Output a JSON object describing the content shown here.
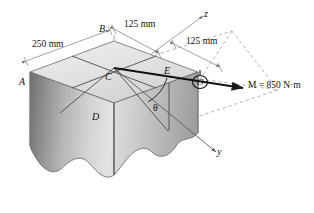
{
  "figure": {
    "background": "#ffffff",
    "line_color": "#4d4d4d",
    "dark_line_color": "#1a1a1a",
    "dash_color": "#9a9a9a",
    "block_light": "#e6e6e6",
    "block_mid": "#c8c8c8",
    "block_dark": "#9e9e9e"
  },
  "labels": {
    "point_a": "A",
    "point_b": "B",
    "point_c": "C",
    "point_d": "D",
    "point_e": "E",
    "point_o": "O",
    "axis_y": "y",
    "axis_z": "z",
    "angle_theta": "θ"
  },
  "dimensions": {
    "width_250": "250 mm",
    "depth_125_upper": "125 mm",
    "depth_125_lower": "125 mm"
  },
  "moment": {
    "label": "M = 850 N·m",
    "symbol": "M",
    "magnitude": "850",
    "unit": "N·m"
  }
}
